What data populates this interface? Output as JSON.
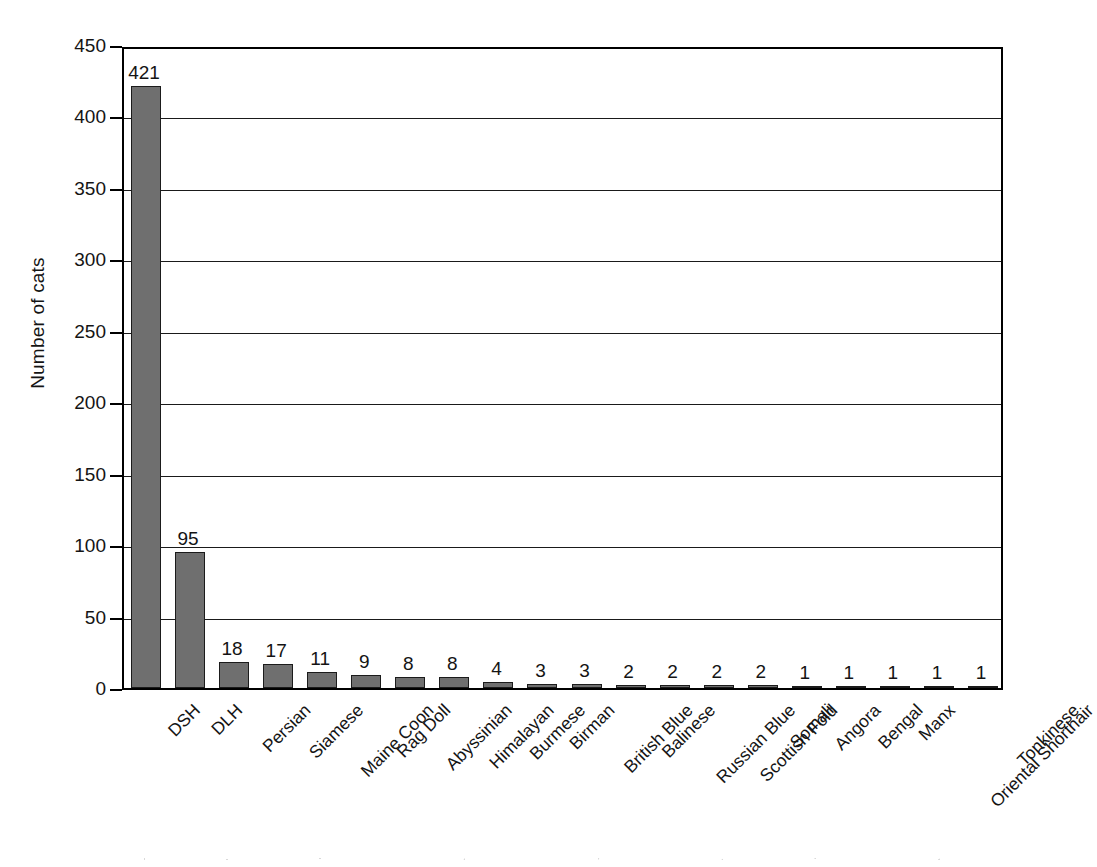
{
  "chart_data": {
    "type": "bar",
    "title": "",
    "subtitle": "",
    "xlabel": "",
    "ylabel": "Number of cats",
    "ylim": [
      0,
      450
    ],
    "ytick_step": 50,
    "yticks": [
      0,
      50,
      100,
      150,
      200,
      250,
      300,
      350,
      400,
      450
    ],
    "ytick_labels": [
      "0",
      "50",
      "100",
      "150",
      "200",
      "250",
      "300",
      "350",
      "400",
      "450"
    ],
    "grid": true,
    "grid_axis": "y",
    "legend": false,
    "legend_position": "none",
    "bar_color": "#6f6f6f",
    "bar_edge_color": "#1b1b1b",
    "axis_color": "#000000",
    "show_value_labels": true,
    "categories": [
      "DSH",
      "DLH",
      "Persian",
      "Siamese",
      "Maine Coon",
      "Rag Doll",
      "Abyssinian",
      "Himalayan",
      "Burmese",
      "Birman",
      "British Blue",
      "Balinese",
      "Russian Blue",
      "Scottish Fold",
      "Somali",
      "Angora",
      "Bengal",
      "Manx",
      "Oriental Shorthair",
      "Tonkinese"
    ],
    "values": [
      421,
      95,
      18,
      17,
      11,
      9,
      8,
      8,
      4,
      3,
      3,
      2,
      2,
      2,
      2,
      1,
      1,
      1,
      1,
      1
    ],
    "value_labels": [
      "421",
      "95",
      "18",
      "17",
      "11",
      "9",
      "8",
      "8",
      "4",
      "3",
      "3",
      "2",
      "2",
      "2",
      "2",
      "1",
      "1",
      "1",
      "1",
      "1"
    ]
  }
}
